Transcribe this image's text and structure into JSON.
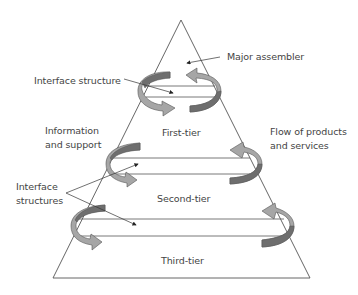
{
  "diagram": {
    "type": "tiered supply pyramid",
    "tiers": [
      {
        "label": "First-tier"
      },
      {
        "label": "Second-tier"
      },
      {
        "label": "Third-tier"
      }
    ],
    "annotations": {
      "major_assembler": "Major assembler",
      "interface_structure": "Interface structure",
      "information_line1": "Information",
      "information_line2": "and support",
      "flow_line1": "Flow of products",
      "flow_line2": "and services",
      "interface_structures_line1": "Interface",
      "interface_structures_line2": "structures"
    },
    "colors": {
      "outline": "#555555",
      "arrow_light": "#a6a6a6",
      "arrow_dark": "#6e6e6e",
      "text": "#444444"
    }
  }
}
